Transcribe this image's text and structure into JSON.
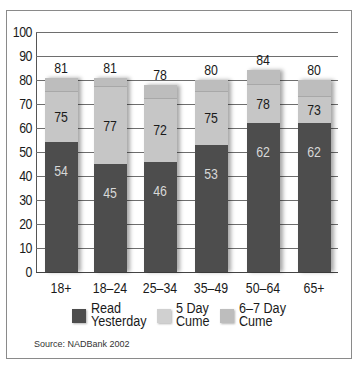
{
  "chart_data": {
    "type": "bar",
    "stacked": true,
    "title": "",
    "xlabel": "",
    "ylabel": "",
    "ylim": [
      0,
      100
    ],
    "yticks": [
      0,
      10,
      20,
      30,
      40,
      50,
      60,
      70,
      80,
      90,
      100
    ],
    "grid": true,
    "legend_position": "bottom",
    "categories": [
      "18+",
      "18–24",
      "25–34",
      "35–49",
      "50–64",
      "65+"
    ],
    "series": [
      {
        "name": "Read Yesterday",
        "values": [
          54,
          45,
          46,
          53,
          62,
          62
        ],
        "color": "#4d4d4d"
      },
      {
        "name": "5 Day Cume",
        "values": [
          75,
          77,
          72,
          75,
          78,
          73
        ],
        "color": "#c6c6c6"
      },
      {
        "name": "6–7 Day Cume",
        "values": [
          81,
          81,
          78,
          80,
          84,
          80
        ],
        "color": "#bdbdbd"
      }
    ],
    "note": "Values are cumulative reach (%); each bar shows Read Yesterday, 5 Day Cume, and 6–7 Day Cume levels.",
    "source": "Source: NADBank 2002"
  },
  "yaxis": {
    "ticks": [
      "0",
      "10",
      "20",
      "30",
      "40",
      "50",
      "60",
      "70",
      "80",
      "90",
      "100"
    ]
  },
  "bars": [
    {
      "category": "18+",
      "read": "54",
      "five": "75",
      "seven": "81"
    },
    {
      "category": "18–24",
      "read": "45",
      "five": "77",
      "seven": "81"
    },
    {
      "category": "25–34",
      "read": "46",
      "five": "72",
      "seven": "78"
    },
    {
      "category": "35–49",
      "read": "53",
      "five": "75",
      "seven": "80"
    },
    {
      "category": "50–64",
      "read": "62",
      "five": "78",
      "seven": "84"
    },
    {
      "category": "65+",
      "read": "62",
      "five": "73",
      "seven": "80"
    }
  ],
  "legend": [
    {
      "line1": "Read",
      "line2": "Yesterday",
      "color": "#4d4d4d"
    },
    {
      "line1": "5 Day",
      "line2": "Cume",
      "color": "#c6c6c6"
    },
    {
      "line1": "6–7 Day",
      "line2": "Cume",
      "color": "#bdbdbd"
    }
  ],
  "source": "Source: NADBank 2002"
}
